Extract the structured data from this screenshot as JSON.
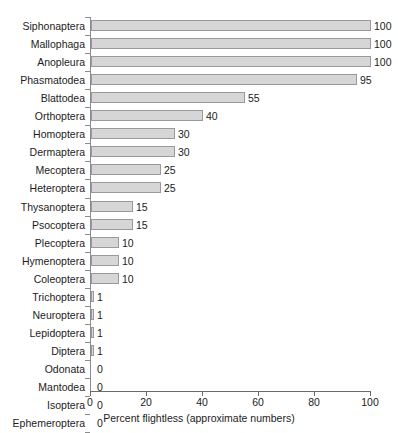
{
  "chart_data": {
    "type": "bar",
    "orientation": "horizontal",
    "title": "",
    "xlabel": "Percent flightless (approximate numbers)",
    "ylabel": "",
    "xlim": [
      0,
      100
    ],
    "xticks": [
      0,
      20,
      40,
      60,
      80,
      100
    ],
    "grid": false,
    "legend": false,
    "value_labels": true,
    "categories": [
      "Siphonaptera",
      "Mallophaga",
      "Anopleura",
      "Phasmatodea",
      "Blattodea",
      "Orthoptera",
      "Homoptera",
      "Dermaptera",
      "Mecoptera",
      "Heteroptera",
      "Thysanoptera",
      "Psocoptera",
      "Plecoptera",
      "Hymenoptera",
      "Coleoptera",
      "Trichoptera",
      "Neuroptera",
      "Lepidoptera",
      "Diptera",
      "Odonata",
      "Mantodea",
      "Isoptera",
      "Ephemeroptera"
    ],
    "values": [
      100,
      100,
      100,
      95,
      55,
      40,
      30,
      30,
      25,
      25,
      15,
      15,
      10,
      10,
      10,
      1,
      1,
      1,
      1,
      0,
      0,
      0,
      0
    ],
    "value_text": [
      "100",
      "100",
      "100",
      "95",
      "55",
      "40",
      "30",
      "30",
      "25",
      "25",
      "15",
      "15",
      "10",
      "10",
      "10",
      "1",
      "1",
      "1",
      "1",
      "0",
      "0",
      "0",
      "0"
    ],
    "series": [
      {
        "name": "Percent flightless",
        "values": [
          100,
          100,
          100,
          95,
          55,
          40,
          30,
          30,
          25,
          25,
          15,
          15,
          10,
          10,
          10,
          1,
          1,
          1,
          1,
          0,
          0,
          0,
          0
        ]
      }
    ]
  },
  "colors": {
    "bar_fill": "#d6d6d6",
    "bar_border": "#9a9a9a",
    "axis": "#6b6b6b",
    "text": "#1c1c1c",
    "background": "#ffffff"
  }
}
